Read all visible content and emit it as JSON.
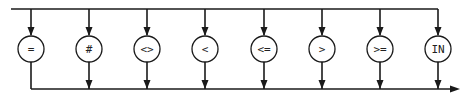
{
  "diagram": {
    "type": "syntax-diagram",
    "operators": [
      {
        "label": "="
      },
      {
        "label": "#"
      },
      {
        "label": "<>"
      },
      {
        "label": "<"
      },
      {
        "label": "<="
      },
      {
        "label": ">"
      },
      {
        "label": ">="
      },
      {
        "label": "IN"
      }
    ],
    "colors": {
      "line": "#1a1a1a",
      "background": "#ffffff"
    }
  }
}
